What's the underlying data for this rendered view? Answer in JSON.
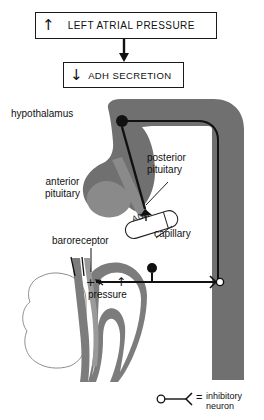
{
  "diagram": {
    "colors": {
      "brain_gray": "#707070",
      "pituitary_gray": "#8a8a8a",
      "heart_gray": "#7c7c7c",
      "line_black": "#111111",
      "background": "#ffffff"
    }
  },
  "flow": {
    "box_lap": {
      "arrow": "↑",
      "label": "LEFT ATRIAL PRESSURE"
    },
    "box_adh": {
      "arrow": "↓",
      "label": "ADH  SECRETION"
    }
  },
  "labels": {
    "hypothalamus": "hypothalamus",
    "anterior_pituitary": "anterior\npituitary",
    "anterior_pituitary_line1": "anterior",
    "anterior_pituitary_line2": "pituitary",
    "posterior_pituitary_line1": "posterior",
    "posterior_pituitary_line2": "pituitary",
    "capillary": "capillary",
    "baroreceptor": "baroreceptor",
    "pressure": "pressure",
    "adh_tube": "ADH"
  },
  "symbols": {
    "plus": "+",
    "up_arrow": "↑",
    "equals": "="
  },
  "legend": {
    "equals": "=",
    "text_line1": "inhibitory",
    "text_line2": "neuron",
    "text": "inhibitory neuron"
  }
}
